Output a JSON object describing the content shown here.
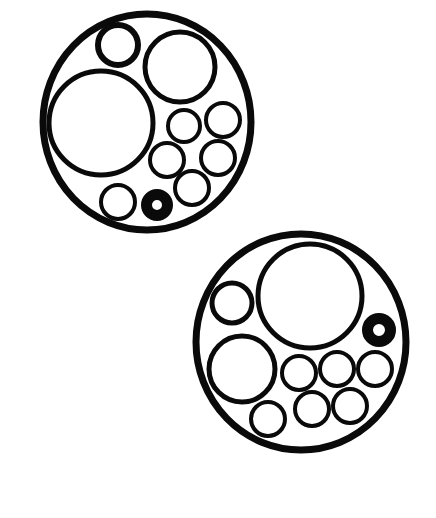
{
  "figure": {
    "background": "#ffffff",
    "ink": "#0a0a0a",
    "groups": [
      {
        "name": "upper-circle-group",
        "outer": {
          "cx": 147,
          "cy": 122,
          "rx": 104,
          "ry": 108,
          "stroke": 7
        },
        "circles": [
          {
            "cx": 118,
            "cy": 45,
            "r": 20,
            "stroke": 6
          },
          {
            "cx": 180,
            "cy": 67,
            "r": 35,
            "stroke": 5
          },
          {
            "cx": 101,
            "cy": 123,
            "r": 52,
            "stroke": 5
          },
          {
            "cx": 184,
            "cy": 126,
            "r": 16,
            "stroke": 4
          },
          {
            "cx": 223,
            "cy": 120,
            "r": 17,
            "stroke": 4
          },
          {
            "cx": 167,
            "cy": 160,
            "r": 17,
            "stroke": 4
          },
          {
            "cx": 218,
            "cy": 158,
            "r": 17,
            "stroke": 4
          },
          {
            "cx": 118,
            "cy": 202,
            "r": 17,
            "stroke": 4
          },
          {
            "cx": 192,
            "cy": 188,
            "r": 17,
            "stroke": 4
          }
        ],
        "rings": [
          {
            "cx": 157,
            "cy": 205,
            "r": 16,
            "hole": 5
          }
        ]
      },
      {
        "name": "lower-circle-group",
        "outer": {
          "cx": 301,
          "cy": 342,
          "rx": 105,
          "ry": 108,
          "stroke": 7
        },
        "circles": [
          {
            "cx": 310,
            "cy": 296,
            "r": 52,
            "stroke": 5
          },
          {
            "cx": 232,
            "cy": 303,
            "r": 20,
            "stroke": 5
          },
          {
            "cx": 242,
            "cy": 369,
            "r": 33,
            "stroke": 5
          },
          {
            "cx": 299,
            "cy": 373,
            "r": 17,
            "stroke": 4
          },
          {
            "cx": 337,
            "cy": 369,
            "r": 17,
            "stroke": 4
          },
          {
            "cx": 375,
            "cy": 369,
            "r": 17,
            "stroke": 4
          },
          {
            "cx": 268,
            "cy": 419,
            "r": 17,
            "stroke": 4
          },
          {
            "cx": 312,
            "cy": 409,
            "r": 17,
            "stroke": 4
          },
          {
            "cx": 350,
            "cy": 406,
            "r": 17,
            "stroke": 4
          }
        ],
        "rings": [
          {
            "cx": 379,
            "cy": 330,
            "r": 17,
            "hole": 6
          }
        ]
      }
    ]
  }
}
